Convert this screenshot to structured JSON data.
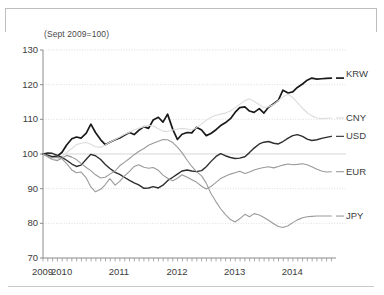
{
  "chart_data": {
    "type": "line",
    "title": "",
    "subtitle": "(Sept 2009=100)",
    "xlabel": "",
    "ylabel": "",
    "ylim": [
      70,
      130
    ],
    "yticks": [
      70,
      80,
      90,
      100,
      110,
      120,
      130
    ],
    "xlim": [
      2009.67,
      2014.75
    ],
    "xticks": [
      2009,
      2010,
      2011,
      2012,
      2013,
      2014
    ],
    "xtick_labels": [
      "2009",
      "2010",
      "2011",
      "2012",
      "2013",
      "2014"
    ],
    "grid": true,
    "legend_position": "right-inline",
    "minor_tick_interval_months": 1,
    "x": [
      2009.67,
      2009.75,
      2009.83,
      2009.92,
      2010.0,
      2010.08,
      2010.17,
      2010.25,
      2010.33,
      2010.42,
      2010.5,
      2010.58,
      2010.67,
      2010.75,
      2010.83,
      2010.92,
      2011.0,
      2011.08,
      2011.17,
      2011.25,
      2011.33,
      2011.42,
      2011.5,
      2011.58,
      2011.67,
      2011.75,
      2011.83,
      2011.92,
      2012.0,
      2012.08,
      2012.17,
      2012.25,
      2012.33,
      2012.42,
      2012.5,
      2012.58,
      2012.67,
      2012.75,
      2012.83,
      2012.92,
      2013.0,
      2013.08,
      2013.17,
      2013.25,
      2013.33,
      2013.42,
      2013.5,
      2013.58,
      2013.67,
      2013.75,
      2013.83,
      2013.92,
      2014.0,
      2014.08,
      2014.17,
      2014.25,
      2014.33,
      2014.42,
      2014.5,
      2014.58,
      2014.67
    ],
    "series": [
      {
        "name": "KRW",
        "color": "#1a1a1a",
        "label": "KRW",
        "final_value": 122,
        "values": [
          100.0,
          99.6,
          99.2,
          99.4,
          100.5,
          102.6,
          104.4,
          104.9,
          104.6,
          106.0,
          108.6,
          106.2,
          104.1,
          102.7,
          103.4,
          104.1,
          104.6,
          105.4,
          106.2,
          105.6,
          106.8,
          107.9,
          107.4,
          109.8,
          110.6,
          109.2,
          111.5,
          107.1,
          104.2,
          105.7,
          106.2,
          106.1,
          107.7,
          106.9,
          105.3,
          105.9,
          107.0,
          108.2,
          109.0,
          110.2,
          112.0,
          113.4,
          113.6,
          112.4,
          112.0,
          113.1,
          111.8,
          113.5,
          114.5,
          115.5,
          118.4,
          117.6,
          117.9,
          119.2,
          120.2,
          121.3,
          121.9,
          121.6,
          121.7,
          121.8,
          121.9
        ]
      },
      {
        "name": "CNY",
        "color": "#dcdcdc",
        "label": "CNY",
        "final_value": 110,
        "values": [
          100.0,
          99.3,
          98.6,
          98.5,
          99.2,
          100.4,
          101.6,
          102.7,
          103.1,
          103.3,
          102.8,
          102.1,
          101.9,
          102.6,
          103.4,
          104.2,
          104.9,
          105.6,
          106.3,
          106.9,
          107.4,
          107.9,
          108.3,
          108.1,
          107.3,
          106.6,
          106.5,
          106.9,
          107.2,
          107.4,
          107.2,
          106.9,
          107.6,
          108.7,
          109.7,
          110.6,
          111.2,
          111.5,
          111.8,
          112.4,
          113.3,
          114.3,
          115.4,
          115.9,
          115.2,
          114.2,
          113.4,
          113.6,
          114.3,
          115.4,
          116.5,
          117.2,
          116.3,
          114.8,
          113.2,
          111.9,
          111.0,
          110.4,
          110.2,
          110.3,
          110.4
        ]
      },
      {
        "name": "USD",
        "color": "#2e2e2e",
        "label": "USD",
        "final_value": 105,
        "values": [
          100.0,
          100.3,
          100.2,
          99.6,
          99.0,
          98.2,
          97.1,
          96.4,
          96.8,
          98.5,
          99.9,
          99.5,
          98.4,
          97.0,
          95.8,
          94.7,
          94.1,
          93.3,
          92.4,
          91.7,
          91.1,
          90.1,
          90.2,
          90.6,
          90.2,
          91.0,
          92.3,
          93.3,
          94.2,
          95.1,
          95.4,
          95.1,
          94.9,
          95.2,
          96.3,
          97.8,
          99.3,
          100.1,
          99.5,
          99.0,
          98.7,
          98.8,
          99.2,
          100.4,
          101.7,
          102.9,
          103.4,
          103.6,
          103.1,
          102.9,
          103.6,
          104.6,
          105.3,
          105.6,
          105.1,
          104.3,
          103.9,
          104.1,
          104.5,
          104.8,
          105.1
        ]
      },
      {
        "name": "EUR",
        "color": "#9a9a9a",
        "label": "EUR",
        "final_value": 95,
        "values": [
          100.0,
          99.4,
          98.9,
          99.1,
          98.6,
          97.2,
          95.4,
          94.6,
          94.8,
          93.1,
          90.5,
          89.1,
          89.8,
          91.2,
          92.9,
          91.0,
          92.1,
          93.6,
          95.0,
          96.4,
          96.9,
          96.2,
          95.9,
          96.1,
          95.3,
          93.9,
          93.0,
          92.3,
          93.0,
          94.0,
          93.3,
          92.6,
          91.9,
          90.7,
          89.9,
          90.6,
          91.8,
          92.9,
          93.6,
          94.2,
          94.6,
          95.0,
          94.4,
          94.8,
          95.4,
          95.8,
          96.1,
          96.3,
          96.0,
          96.4,
          96.8,
          97.1,
          96.9,
          97.0,
          97.2,
          96.9,
          96.3,
          95.6,
          95.1,
          94.8,
          94.9
        ]
      },
      {
        "name": "JPY",
        "color": "#9a9a9a",
        "label": "JPY",
        "final_value": 82,
        "values": [
          100.0,
          99.2,
          98.4,
          98.1,
          98.8,
          99.6,
          99.1,
          98.4,
          97.3,
          96.1,
          95.2,
          94.0,
          93.1,
          93.3,
          94.2,
          95.1,
          96.6,
          97.6,
          98.7,
          99.8,
          100.7,
          101.6,
          102.5,
          103.1,
          103.7,
          104.2,
          104.1,
          103.3,
          102.0,
          100.4,
          98.2,
          96.4,
          94.9,
          93.7,
          91.6,
          88.7,
          86.2,
          84.2,
          82.6,
          81.1,
          80.4,
          81.3,
          82.6,
          81.9,
          82.8,
          82.4,
          81.7,
          80.9,
          79.9,
          79.1,
          78.8,
          79.3,
          80.2,
          81.0,
          81.6,
          81.9,
          82.0,
          82.1,
          82.1,
          82.1,
          82.1
        ]
      }
    ]
  }
}
